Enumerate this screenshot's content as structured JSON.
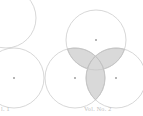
{
  "figure": {
    "width": 143,
    "height": 116,
    "background_color": "#ffffff"
  },
  "style": {
    "circle_stroke_color": "#c6c6c6",
    "circle_stroke_width": 0.7,
    "circle_fill": "none",
    "lens_fill_color": "#d9d9d9",
    "lens_stroke_color": "#a9a9a9",
    "lens_stroke_width": 0.6,
    "center_dot_color": "#5a5a5a",
    "center_dot_radius": 0.8,
    "caption_color": "#b4b4b4"
  },
  "diagrams": [
    {
      "id": "diagram-left",
      "name": "two-circle-intersection",
      "caption": "l. 1",
      "caption_x": 1,
      "caption_y": 106,
      "circles": [
        {
          "id": "left-upper-circle",
          "label": "upper circle",
          "cx": 6,
          "cy": 18,
          "r": 30,
          "has_center_dot": false
        },
        {
          "id": "left-lower-circle",
          "label": "lower circle",
          "cx": 14,
          "cy": 78,
          "r": 30,
          "has_center_dot": true
        }
      ],
      "shaded_regions": [
        {
          "id": "left-lens",
          "label": "intersection lens of upper and lower circles",
          "circle_a": "left-upper-circle",
          "circle_b": "left-lower-circle"
        }
      ]
    },
    {
      "id": "diagram-right",
      "name": "three-circle-intersection",
      "caption": "Vol. No. 2",
      "caption_x": 84,
      "caption_y": 106,
      "circles": [
        {
          "id": "right-top-circle",
          "label": "top circle",
          "cx": 96,
          "cy": 40,
          "r": 30,
          "has_center_dot": true
        },
        {
          "id": "right-bottomleft-circle",
          "label": "bottom-left circle",
          "cx": 75,
          "cy": 78,
          "r": 30,
          "has_center_dot": true
        },
        {
          "id": "right-bottomright-circle",
          "label": "bottom-right circle",
          "cx": 116,
          "cy": 78,
          "r": 30,
          "has_center_dot": true
        }
      ],
      "shaded_regions": [
        {
          "id": "right-lens-top-left",
          "label": "intersection lens of top and bottom-left circles",
          "circle_a": "right-top-circle",
          "circle_b": "right-bottomleft-circle"
        },
        {
          "id": "right-lens-top-right",
          "label": "intersection lens of top and bottom-right circles",
          "circle_a": "right-top-circle",
          "circle_b": "right-bottomright-circle"
        },
        {
          "id": "right-lens-bottom",
          "label": "intersection lens of bottom-left and bottom-right circles",
          "circle_a": "right-bottomleft-circle",
          "circle_b": "right-bottomright-circle"
        }
      ]
    }
  ]
}
